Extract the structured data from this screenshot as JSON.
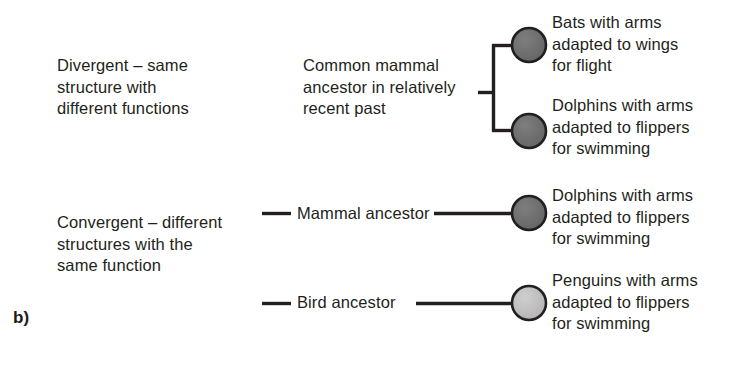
{
  "figure": {
    "panel_letter": "b)",
    "stroke_color": "#231f20",
    "text_color": "#231f20",
    "background": "#ffffff",
    "node_dark_fill": "#6e6e6e",
    "node_light_fill": "#bdbdbd",
    "node_stroke": "#231f20"
  },
  "divergent": {
    "label": "Divergent – same\nstructure with\ndifferent functions",
    "ancestor_label": "Common mammal\nancestor in relatively\nrecent past",
    "outcomes": [
      {
        "id": "bats",
        "label": "Bats with arms\nadapted to wings\nfor flight",
        "node_shade": "dark"
      },
      {
        "id": "dolphins",
        "label": "Dolphins with arms\nadapted to flippers\nfor swimming",
        "node_shade": "dark"
      }
    ]
  },
  "convergent": {
    "label": "Convergent – different\nstructures with the\nsame function",
    "branches": [
      {
        "id": "mammal",
        "ancestor_label": "Mammal ancestor",
        "outcome_label": "Dolphins with arms\nadapted to flippers\nfor swimming",
        "node_shade": "dark"
      },
      {
        "id": "bird",
        "ancestor_label": "Bird ancestor",
        "outcome_label": "Penguins with arms\nadapted to flippers\nfor swimming",
        "node_shade": "light"
      }
    ]
  }
}
